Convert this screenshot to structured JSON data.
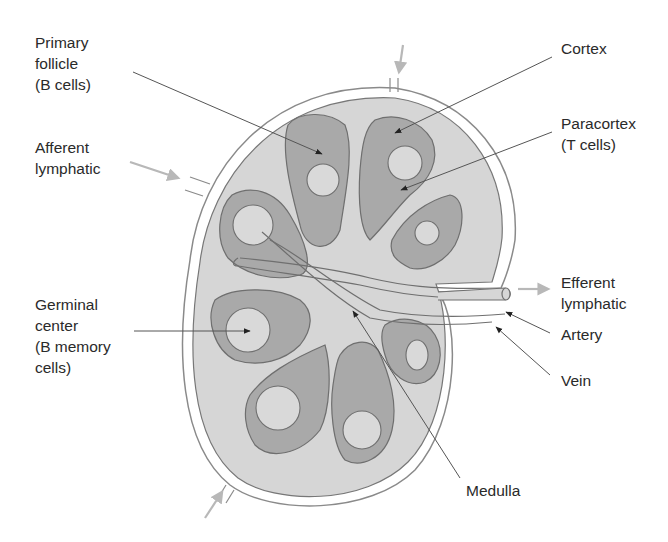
{
  "labels": {
    "primary_follicle": "Primary\nfollicle\n(B cells)",
    "afferent_lymphatic": "Afferent\nlymphatic",
    "germinal_center": "Germinal\ncenter\n(B memory\ncells)",
    "cortex": "Cortex",
    "paracortex": "Paracortex\n(T cells)",
    "efferent_lymphatic": "Efferent\nlymphatic",
    "artery": "Artery",
    "vein": "Vein",
    "medulla": "Medulla"
  },
  "colors": {
    "capsule_fill": "#d6d6d6",
    "lobule_fill": "#a9a9a9",
    "follicle_fill": "#d9d9d9",
    "outline": "#6f6f6f",
    "pointer": "#3a3a3a",
    "flow_arrow": "#b8b8b8",
    "text": "#2a2a2a"
  }
}
